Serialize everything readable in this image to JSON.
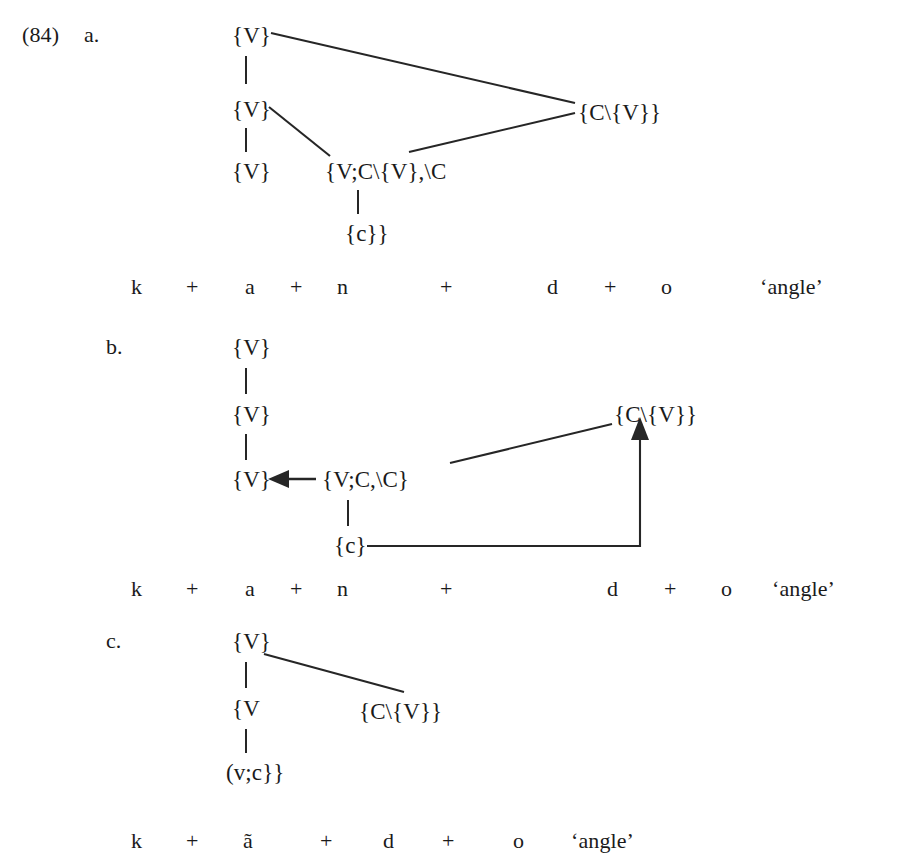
{
  "figure": {
    "example_number": "(84)",
    "background_color": "#ffffff",
    "ink_color": "#262626"
  },
  "subfigures": [
    {
      "label": "a.",
      "label_pos": {
        "x": 84,
        "y": 24
      },
      "nodes": [
        {
          "name": "root-v",
          "text": "{V}",
          "x": 232,
          "y": 24
        },
        {
          "name": "mid-v",
          "text": "{V}",
          "x": 232,
          "y": 98
        },
        {
          "name": "leaf-v",
          "text": "{V}",
          "x": 232,
          "y": 160
        },
        {
          "name": "complex-node",
          "text": "{V;C\\{V},\\C",
          "x": 325,
          "y": 160
        },
        {
          "name": "c-leaf",
          "text": "{c}}",
          "x": 345,
          "y": 222
        },
        {
          "name": "cv-node",
          "text": "{C\\{V}}",
          "x": 578,
          "y": 101
        }
      ],
      "segments": {
        "name": "segmentation-row-a",
        "y": 276,
        "items": [
          {
            "text": "k",
            "x": 131
          },
          {
            "text": "+",
            "x": 186
          },
          {
            "text": "a",
            "x": 245
          },
          {
            "text": "+",
            "x": 290
          },
          {
            "text": "n",
            "x": 337
          },
          {
            "text": "+",
            "x": 440
          },
          {
            "text": "d",
            "x": 547
          },
          {
            "text": "+",
            "x": 604
          },
          {
            "text": "o",
            "x": 661
          }
        ],
        "gloss": {
          "text": "‘angle’",
          "x": 760
        }
      }
    },
    {
      "label": "b.",
      "label_pos": {
        "x": 106,
        "y": 336
      },
      "nodes": [
        {
          "name": "root-v",
          "text": "{V}",
          "x": 232,
          "y": 336
        },
        {
          "name": "mid-v",
          "text": "{V}",
          "x": 232,
          "y": 403
        },
        {
          "name": "leaf-v",
          "text": "{V}",
          "x": 232,
          "y": 468
        },
        {
          "name": "vcc-node",
          "text": "{V;C,\\C}",
          "x": 322,
          "y": 468
        },
        {
          "name": "c-leaf",
          "text": "{c}",
          "x": 334,
          "y": 534
        },
        {
          "name": "cv-node",
          "text": "{C\\{V}}",
          "x": 614,
          "y": 403
        }
      ],
      "segments": {
        "name": "segmentation-row-b",
        "y": 578,
        "items": [
          {
            "text": "k",
            "x": 131
          },
          {
            "text": "+",
            "x": 186
          },
          {
            "text": "a",
            "x": 245
          },
          {
            "text": "+",
            "x": 290
          },
          {
            "text": "n",
            "x": 337
          },
          {
            "text": "+",
            "x": 440
          },
          {
            "text": "d",
            "x": 607
          },
          {
            "text": "+",
            "x": 664
          },
          {
            "text": "o",
            "x": 721
          }
        ],
        "gloss": {
          "text": "‘angle’",
          "x": 772
        }
      }
    },
    {
      "label": "c.",
      "label_pos": {
        "x": 106,
        "y": 630
      },
      "nodes": [
        {
          "name": "root-v",
          "text": "{V}",
          "x": 232,
          "y": 630
        },
        {
          "name": "mid-v",
          "text": "{V",
          "x": 232,
          "y": 697
        },
        {
          "name": "vc-leaf",
          "text": "(v;c}}",
          "x": 226,
          "y": 761
        },
        {
          "name": "cv-node",
          "text": "{C\\{V}}",
          "x": 359,
          "y": 700
        }
      ],
      "segments": {
        "name": "segmentation-row-c",
        "y": 830,
        "items": [
          {
            "text": "k",
            "x": 131
          },
          {
            "text": "+",
            "x": 186
          },
          {
            "text": "ã",
            "x": 243
          },
          {
            "text": "+",
            "x": 320
          },
          {
            "text": "d",
            "x": 383
          },
          {
            "text": "+",
            "x": 442
          },
          {
            "text": "o",
            "x": 513
          }
        ],
        "gloss": {
          "text": "‘angle’",
          "x": 571
        }
      }
    }
  ]
}
